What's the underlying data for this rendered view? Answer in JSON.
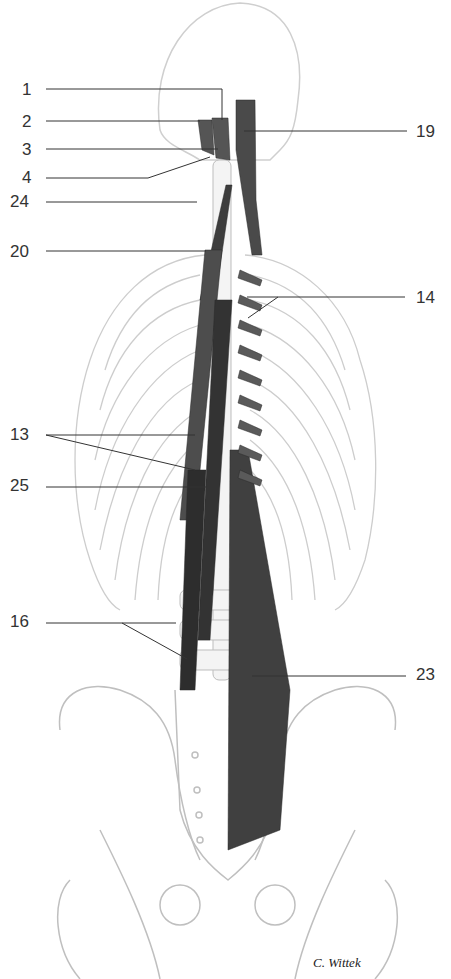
{
  "figure": {
    "colors": {
      "bone_outline": "#c8c8c8",
      "muscle": "#3a3a3a",
      "leader_line": "#333333",
      "label": "#333333",
      "background": "#ffffff"
    },
    "signature": "C. Wittek"
  },
  "labels": [
    {
      "id": "1",
      "text": "1",
      "side": "left",
      "x": 22,
      "y": 81
    },
    {
      "id": "2",
      "text": "2",
      "side": "left",
      "x": 22,
      "y": 113
    },
    {
      "id": "3",
      "text": "3",
      "side": "left",
      "x": 22,
      "y": 141
    },
    {
      "id": "4",
      "text": "4",
      "side": "left",
      "x": 22,
      "y": 169
    },
    {
      "id": "24",
      "text": "24",
      "side": "left",
      "x": 10,
      "y": 193
    },
    {
      "id": "20",
      "text": "20",
      "side": "left",
      "x": 10,
      "y": 243
    },
    {
      "id": "19",
      "text": "19",
      "side": "right",
      "x": 416,
      "y": 123
    },
    {
      "id": "14",
      "text": "14",
      "side": "right",
      "x": 416,
      "y": 289
    },
    {
      "id": "13",
      "text": "13",
      "side": "left",
      "x": 10,
      "y": 426
    },
    {
      "id": "25",
      "text": "25",
      "side": "left",
      "x": 10,
      "y": 477
    },
    {
      "id": "16",
      "text": "16",
      "side": "left",
      "x": 10,
      "y": 613
    },
    {
      "id": "23",
      "text": "23",
      "side": "right",
      "x": 416,
      "y": 666
    }
  ]
}
